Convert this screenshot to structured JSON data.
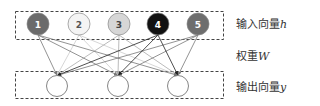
{
  "diagram": {
    "input_layer": {
      "label": "输入向量",
      "symbol": "h",
      "nodes": [
        {
          "label": "1",
          "fill": "#6b6b6b",
          "text_color": "#ffffff",
          "cx": 38,
          "cy": 24
        },
        {
          "label": "2",
          "fill": "#f4f4f4",
          "text_color": "#555555",
          "cx": 79,
          "cy": 24
        },
        {
          "label": "3",
          "fill": "#d6d6d6",
          "text_color": "#444444",
          "cx": 119,
          "cy": 24
        },
        {
          "label": "4",
          "fill": "#111111",
          "text_color": "#ffffff",
          "cx": 158,
          "cy": 24
        },
        {
          "label": "5",
          "fill": "#6e6e6e",
          "text_color": "#ffffff",
          "cx": 198,
          "cy": 24
        }
      ]
    },
    "weights": {
      "label": "权重",
      "symbol": "W"
    },
    "output_layer": {
      "label": "输出向量",
      "symbol": "y",
      "nodes": [
        {
          "cx": 57,
          "cy": 86
        },
        {
          "cx": 118,
          "cy": 86
        },
        {
          "cx": 178,
          "cy": 86
        }
      ]
    },
    "edge_colors": [
      "#777777",
      "#cccccc",
      "#aaaaaa",
      "#222222",
      "#777777"
    ]
  }
}
